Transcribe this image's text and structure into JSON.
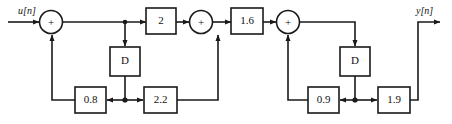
{
  "diagram": {
    "type": "signal-flow-block-diagram",
    "stroke_color": "#1a1a1a",
    "box_fill": "#ffffff",
    "background": "#ffffff",
    "input": {
      "label": "u[n]"
    },
    "output": {
      "label": "y[n]"
    },
    "adders": [
      {
        "id": "adder-1",
        "symbol": "+"
      },
      {
        "id": "adder-2",
        "symbol": "+"
      },
      {
        "id": "adder-3",
        "symbol": "+"
      }
    ],
    "delays": [
      {
        "id": "delay-1",
        "label": "D"
      },
      {
        "id": "delay-2",
        "label": "D"
      }
    ],
    "gains": [
      {
        "id": "gain-forward-1",
        "label": "2"
      },
      {
        "id": "gain-forward-2",
        "label": "1.6"
      },
      {
        "id": "gain-feedback-1",
        "label": "0.8"
      },
      {
        "id": "gain-feedforward-1",
        "label": "2.2"
      },
      {
        "id": "gain-feedback-2",
        "label": "0.9"
      },
      {
        "id": "gain-feedforward-2",
        "label": "1.9"
      }
    ],
    "section_1": {
      "forward_gain": "2",
      "feedback_gain": "0.8",
      "feedforward_gain": "2.2",
      "delay": "D"
    },
    "section_2": {
      "forward_gain": "1.6",
      "feedback_gain": "0.9",
      "feedforward_gain": "1.9",
      "delay": "D"
    }
  }
}
